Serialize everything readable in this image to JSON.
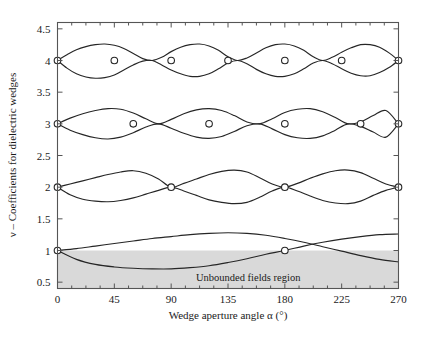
{
  "figure": {
    "caption_partial": "",
    "region_label": "Unbounded fields region"
  },
  "chart_data": {
    "type": "line",
    "title": "",
    "xlabel": "Wedge aperture angle α (°)",
    "ylabel": "ν – Coefficients for dielectric wedges",
    "xlim": [
      0,
      270
    ],
    "ylim": [
      0.4,
      4.6
    ],
    "xticks": [
      0,
      45,
      90,
      135,
      180,
      225,
      270
    ],
    "xtick_labels": [
      "0",
      "45",
      "90",
      "135",
      "180",
      "225",
      "270"
    ],
    "yticks": [
      0.5,
      1,
      1.5,
      2,
      2.5,
      3,
      3.5,
      4,
      4.5
    ],
    "ytick_labels": [
      "0.5",
      "1",
      "1.5",
      "2",
      "2.5",
      "3",
      "3.5",
      "4",
      "4.5"
    ],
    "xtick_minor_step": 11.25,
    "grid": false,
    "legend": null,
    "shaded_region": {
      "label": "Unbounded fields region",
      "y_from": 0.4,
      "y_to": 1.0,
      "x_from": 0,
      "x_to": 270,
      "color": "#d9d9d9"
    },
    "annotations": [
      {
        "text": "Unbounded fields region",
        "x": 150,
        "y": 0.72
      }
    ],
    "series": [
      {
        "name": "nu=4 upper branch",
        "family": 4,
        "x": [
          0,
          7.5,
          15,
          22.5,
          30,
          37.5,
          45,
          52.5,
          60,
          67.5,
          75,
          82.5,
          90,
          97.5,
          105,
          112.5,
          120,
          127.5,
          135,
          142.5,
          150,
          157.5,
          165,
          172.5,
          180,
          187.5,
          195,
          202.5,
          210,
          217.5,
          225,
          232.5,
          240,
          247.5,
          255,
          262.5,
          270
        ],
        "y": [
          4.0,
          4.09,
          4.17,
          4.22,
          4.25,
          4.26,
          4.24,
          4.19,
          4.11,
          4.03,
          4.0,
          4.05,
          4.14,
          4.21,
          4.25,
          4.26,
          4.23,
          4.16,
          4.06,
          4.0,
          4.04,
          4.12,
          4.2,
          4.25,
          4.26,
          4.23,
          4.16,
          4.06,
          4.0,
          4.05,
          4.13,
          4.2,
          4.25,
          4.25,
          4.21,
          4.12,
          4.0
        ]
      },
      {
        "name": "nu=4 lower branch",
        "family": 4,
        "x": [
          0,
          7.5,
          15,
          22.5,
          30,
          37.5,
          45,
          52.5,
          60,
          67.5,
          75,
          82.5,
          90,
          97.5,
          105,
          112.5,
          120,
          127.5,
          135,
          142.5,
          150,
          157.5,
          165,
          172.5,
          180,
          187.5,
          195,
          202.5,
          210,
          217.5,
          225,
          232.5,
          240,
          247.5,
          255,
          262.5,
          270
        ],
        "y": [
          4.0,
          3.88,
          3.79,
          3.74,
          3.72,
          3.73,
          3.77,
          3.85,
          3.93,
          3.99,
          4.0,
          3.93,
          3.85,
          3.79,
          3.75,
          3.75,
          3.79,
          3.87,
          3.96,
          4.0,
          3.95,
          3.86,
          3.79,
          3.75,
          3.75,
          3.79,
          3.87,
          3.96,
          4.0,
          3.95,
          3.87,
          3.8,
          3.76,
          3.76,
          3.81,
          3.89,
          4.0
        ]
      },
      {
        "name": "nu=3 upper branch",
        "family": 3,
        "x": [
          0,
          10,
          20,
          30,
          40,
          50,
          60,
          70,
          80,
          90,
          100,
          110,
          120,
          130,
          140,
          150,
          160,
          170,
          180,
          190,
          200,
          210,
          220,
          230,
          240,
          250,
          260,
          270
        ],
        "y": [
          3.0,
          3.09,
          3.16,
          3.21,
          3.24,
          3.23,
          3.17,
          3.08,
          3.0,
          3.07,
          3.16,
          3.22,
          3.24,
          3.21,
          3.13,
          3.03,
          3.0,
          3.08,
          3.18,
          3.23,
          3.24,
          3.19,
          3.1,
          3.0,
          3.03,
          3.13,
          3.21,
          3.0
        ]
      },
      {
        "name": "nu=3 lower branch",
        "family": 3,
        "x": [
          0,
          10,
          20,
          30,
          40,
          50,
          60,
          70,
          80,
          90,
          100,
          110,
          120,
          130,
          140,
          150,
          160,
          170,
          180,
          190,
          200,
          210,
          220,
          230,
          240,
          250,
          260,
          270
        ],
        "y": [
          3.0,
          2.9,
          2.83,
          2.78,
          2.76,
          2.79,
          2.86,
          2.95,
          3.0,
          2.93,
          2.85,
          2.79,
          2.77,
          2.8,
          2.88,
          2.97,
          3.0,
          2.92,
          2.83,
          2.78,
          2.77,
          2.81,
          2.9,
          3.0,
          2.96,
          2.87,
          2.79,
          3.0
        ]
      },
      {
        "name": "nu=2 upper branch",
        "family": 2,
        "x": [
          0,
          10,
          20,
          30,
          40,
          50,
          60,
          70,
          80,
          90,
          100,
          110,
          120,
          130,
          140,
          150,
          160,
          170,
          180,
          190,
          200,
          210,
          220,
          230,
          240,
          250,
          260,
          270
        ],
        "y": [
          2.0,
          2.05,
          2.1,
          2.15,
          2.2,
          2.24,
          2.26,
          2.22,
          2.13,
          2.0,
          2.06,
          2.13,
          2.2,
          2.25,
          2.27,
          2.24,
          2.15,
          2.05,
          2.0,
          2.06,
          2.14,
          2.21,
          2.26,
          2.27,
          2.23,
          2.14,
          2.05,
          2.0
        ]
      },
      {
        "name": "nu=2 lower branch",
        "family": 2,
        "x": [
          0,
          10,
          20,
          30,
          40,
          50,
          60,
          70,
          80,
          90,
          100,
          110,
          120,
          130,
          140,
          150,
          160,
          170,
          180,
          190,
          200,
          210,
          220,
          230,
          240,
          250,
          260,
          270
        ],
        "y": [
          2.0,
          1.88,
          1.81,
          1.78,
          1.77,
          1.79,
          1.83,
          1.89,
          1.95,
          2.0,
          1.94,
          1.87,
          1.8,
          1.76,
          1.74,
          1.76,
          1.84,
          1.94,
          2.0,
          1.94,
          1.86,
          1.79,
          1.75,
          1.74,
          1.78,
          1.87,
          1.95,
          2.0
        ]
      },
      {
        "name": "nu=1 upper branch",
        "family": 1,
        "x": [
          0,
          15,
          30,
          45,
          60,
          75,
          90,
          105,
          120,
          135,
          150,
          165,
          180,
          195,
          210,
          225,
          240,
          255,
          270
        ],
        "y": [
          1.0,
          1.03,
          1.07,
          1.11,
          1.15,
          1.19,
          1.22,
          1.25,
          1.27,
          1.28,
          1.27,
          1.24,
          1.19,
          1.13,
          1.06,
          0.99,
          0.92,
          0.86,
          0.82
        ]
      },
      {
        "name": "nu=1 lower branch",
        "family": 1,
        "x": [
          0,
          15,
          30,
          45,
          60,
          75,
          90,
          105,
          120,
          135,
          150,
          165,
          180,
          195,
          210,
          225,
          240,
          255,
          270
        ],
        "y": [
          1.0,
          0.86,
          0.78,
          0.74,
          0.72,
          0.71,
          0.71,
          0.73,
          0.76,
          0.81,
          0.87,
          0.94,
          1.0,
          1.07,
          1.13,
          1.18,
          1.22,
          1.25,
          1.26
        ]
      }
    ],
    "markers": [
      {
        "x": 0,
        "y": 4
      },
      {
        "x": 45,
        "y": 4
      },
      {
        "x": 90,
        "y": 4
      },
      {
        "x": 135,
        "y": 4
      },
      {
        "x": 180,
        "y": 4
      },
      {
        "x": 225,
        "y": 4
      },
      {
        "x": 270,
        "y": 4
      },
      {
        "x": 0,
        "y": 3
      },
      {
        "x": 60,
        "y": 3
      },
      {
        "x": 120,
        "y": 3
      },
      {
        "x": 180,
        "y": 3
      },
      {
        "x": 240,
        "y": 3
      },
      {
        "x": 270,
        "y": 3
      },
      {
        "x": 0,
        "y": 2
      },
      {
        "x": 90,
        "y": 2
      },
      {
        "x": 180,
        "y": 2
      },
      {
        "x": 270,
        "y": 2
      },
      {
        "x": 0,
        "y": 1
      },
      {
        "x": 180,
        "y": 1
      }
    ]
  }
}
